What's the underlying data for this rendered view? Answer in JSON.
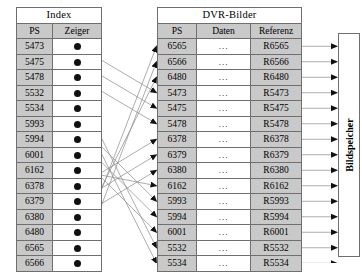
{
  "diagram": {
    "title_left": "Index",
    "title_right": "DVR-Bilder",
    "storage_label": "Bildspeicher"
  },
  "index_table": {
    "title": "Index",
    "columns": [
      "PS",
      "Zeiger"
    ],
    "pointer_glyph": "filled-circle",
    "rows": [
      {
        "ps": "5473",
        "zeiger": ""
      },
      {
        "ps": "5475",
        "zeiger": ""
      },
      {
        "ps": "5478",
        "zeiger": ""
      },
      {
        "ps": "5532",
        "zeiger": ""
      },
      {
        "ps": "5534",
        "zeiger": ""
      },
      {
        "ps": "5993",
        "zeiger": ""
      },
      {
        "ps": "5994",
        "zeiger": ""
      },
      {
        "ps": "6001",
        "zeiger": ""
      },
      {
        "ps": "6162",
        "zeiger": ""
      },
      {
        "ps": "6378",
        "zeiger": ""
      },
      {
        "ps": "6379",
        "zeiger": ""
      },
      {
        "ps": "6380",
        "zeiger": ""
      },
      {
        "ps": "6480",
        "zeiger": ""
      },
      {
        "ps": "6565",
        "zeiger": ""
      },
      {
        "ps": "6566",
        "zeiger": ""
      }
    ]
  },
  "dvr_table": {
    "title": "DVR-Bilder",
    "columns": [
      "PS",
      "Daten",
      "Referenz"
    ],
    "rows": [
      {
        "ps": "6565",
        "daten": "...",
        "referenz": "R6565"
      },
      {
        "ps": "6566",
        "daten": "...",
        "referenz": "R6566"
      },
      {
        "ps": "6480",
        "daten": "...",
        "referenz": "R6480"
      },
      {
        "ps": "5473",
        "daten": "...",
        "referenz": "R5473"
      },
      {
        "ps": "5475",
        "daten": "...",
        "referenz": "R5475"
      },
      {
        "ps": "5478",
        "daten": "...",
        "referenz": "R5478"
      },
      {
        "ps": "6378",
        "daten": "...",
        "referenz": "R6378"
      },
      {
        "ps": "6379",
        "daten": "...",
        "referenz": "R6379"
      },
      {
        "ps": "6380",
        "daten": "...",
        "referenz": "R6380"
      },
      {
        "ps": "6162",
        "daten": "...",
        "referenz": "R6162"
      },
      {
        "ps": "5993",
        "daten": "...",
        "referenz": "R5993"
      },
      {
        "ps": "5994",
        "daten": "...",
        "referenz": "R5994"
      },
      {
        "ps": "6001",
        "daten": "...",
        "referenz": "R6001"
      },
      {
        "ps": "5532",
        "daten": "...",
        "referenz": "R5532"
      },
      {
        "ps": "5534",
        "daten": "...",
        "referenz": "R5534"
      }
    ]
  },
  "storage": {
    "label": "Bildspeicher"
  },
  "mapping": {
    "description": "Each Index Zeiger points to the DVR-Bilder row with the matching PS value",
    "pairs": [
      {
        "from_ps": "5473",
        "to_ps": "5473"
      },
      {
        "from_ps": "5475",
        "to_ps": "5475"
      },
      {
        "from_ps": "5478",
        "to_ps": "5478"
      },
      {
        "from_ps": "5532",
        "to_ps": "5532"
      },
      {
        "from_ps": "5534",
        "to_ps": "5534"
      },
      {
        "from_ps": "5993",
        "to_ps": "5993"
      },
      {
        "from_ps": "5994",
        "to_ps": "5994"
      },
      {
        "from_ps": "6001",
        "to_ps": "6001"
      },
      {
        "from_ps": "6162",
        "to_ps": "6162"
      },
      {
        "from_ps": "6378",
        "to_ps": "6378"
      },
      {
        "from_ps": "6379",
        "to_ps": "6379"
      },
      {
        "from_ps": "6380",
        "to_ps": "6380"
      },
      {
        "from_ps": "6480",
        "to_ps": "6480"
      },
      {
        "from_ps": "6565",
        "to_ps": "6565"
      },
      {
        "from_ps": "6566",
        "to_ps": "6566"
      }
    ]
  },
  "colors": {
    "header_fill": "#c9c9c9",
    "border": "#6f6f6f",
    "line": "#8a8a8a",
    "arrow": "#111111"
  }
}
